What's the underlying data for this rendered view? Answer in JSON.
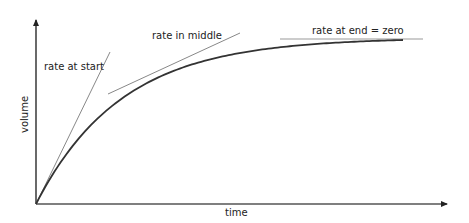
{
  "diagram": {
    "type": "rate-of-reaction curve with tangents",
    "axes": {
      "x_label": "time",
      "y_label": "volume"
    },
    "curve": {
      "description": "volume rises steeply then levels off to a plateau",
      "model": "exponential approach to plateau",
      "color": "#333333"
    },
    "tangents": [
      {
        "label": "rate at start",
        "position": "start",
        "color": "#777777"
      },
      {
        "label": "rate in middle",
        "position": "middle",
        "color": "#777777"
      },
      {
        "label": "rate at end = zero",
        "position": "end",
        "color": "#777777"
      }
    ],
    "colors": {
      "axis": "#333333",
      "text": "#222222"
    }
  }
}
